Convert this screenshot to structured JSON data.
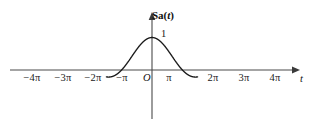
{
  "chart_data": {
    "type": "line",
    "title": "",
    "subtitle": "",
    "xlabel": "t",
    "ylabel": "Sa(t)",
    "function": "Sa(t) = sin(t)/t",
    "grid": false,
    "legend": null,
    "xlim": [
      -4.7123889,
      4.7123889
    ],
    "ylim": [
      -0.25,
      1.1
    ],
    "x_tick_labels": [
      "−4π",
      "−3π",
      "−2π",
      "−π",
      "π",
      "2π",
      "3π",
      "4π"
    ],
    "x_tick_values": [
      -12.566371,
      -9.424778,
      -6.283185,
      -3.141593,
      3.141593,
      6.283185,
      9.424778,
      12.566371
    ],
    "y_tick_labels": [
      "1"
    ],
    "y_tick_values": [
      1
    ],
    "origin_label": "O",
    "annotations": [
      {
        "text": "1",
        "x": 0,
        "y": 1,
        "note": "peak value at origin"
      }
    ],
    "zero_crossings": [
      "−4π",
      "−3π",
      "−2π",
      "−π",
      "π",
      "2π",
      "3π",
      "4π"
    ],
    "lobe_extrema": [
      {
        "x_label": "−3.47π",
        "value": 0.091
      },
      {
        "x_label": "−2.46π",
        "value": -0.128
      },
      {
        "x_label": "−1.43π",
        "value": 0.217
      },
      {
        "x_label": "−0.45π",
        "value": -0.217
      },
      {
        "x_label": "0",
        "value": 1
      },
      {
        "x_label": "1.43π",
        "value": -0.217
      },
      {
        "x_label": "2.46π",
        "value": 0.128
      },
      {
        "x_label": "3.47π",
        "value": -0.091
      }
    ],
    "curve_color": "#1a1a1a",
    "axis_color": "#4a4a4a",
    "background_color": "#ffffff"
  },
  "axes": {
    "y_label_text": "Sa(",
    "y_label_var": "t",
    "y_label_close": ")",
    "x_label": "t",
    "origin": "O",
    "peak_value": "1"
  },
  "ticks": {
    "left": [
      {
        "label": "−4π",
        "px": 32
      },
      {
        "label": "−3π",
        "px": 63
      },
      {
        "label": "−2π",
        "px": 93
      },
      {
        "label": "−π",
        "px": 122
      }
    ],
    "right": [
      {
        "label": "π",
        "px": 169
      },
      {
        "label": "2π",
        "px": 213
      },
      {
        "label": "3π",
        "px": 244
      },
      {
        "label": "4π",
        "px": 275
      }
    ]
  }
}
